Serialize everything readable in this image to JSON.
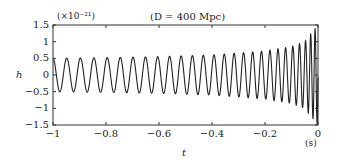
{
  "chart_data": {
    "type": "line",
    "title": "(D = 400 Mpc)",
    "scale_note": "(×10⁻²¹)",
    "xlabel": "t",
    "xunit": "(s)",
    "ylabel": "h",
    "xlim": [
      -1,
      0
    ],
    "ylim": [
      -1.5,
      1.5
    ],
    "x_ticks": [
      "−1",
      "−0.8",
      "−0.6",
      "−0.4",
      "−0.2",
      "0"
    ],
    "y_ticks": [
      "1.5",
      "1",
      "0.5",
      "0",
      "−0.5",
      "−1",
      "−1.5"
    ],
    "grid": false,
    "legend": null,
    "series": [
      {
        "name": "gravitational wave strain (chirp)",
        "description": "Sinusoidal chirp: amplitude ~0.5 at t=-1 s rising to ~1.5 at t=0; frequency ~19 Hz at t=-1 s increasing toward merger",
        "x": [
          -1.0,
          -0.8,
          -0.6,
          -0.4,
          -0.2,
          -0.1,
          -0.05,
          0.0
        ],
        "amplitude": [
          0.5,
          0.52,
          0.55,
          0.6,
          0.72,
          0.85,
          1.0,
          1.5
        ],
        "frequency_hz": [
          19,
          20,
          22,
          25,
          31,
          37,
          45,
          70
        ]
      }
    ]
  }
}
